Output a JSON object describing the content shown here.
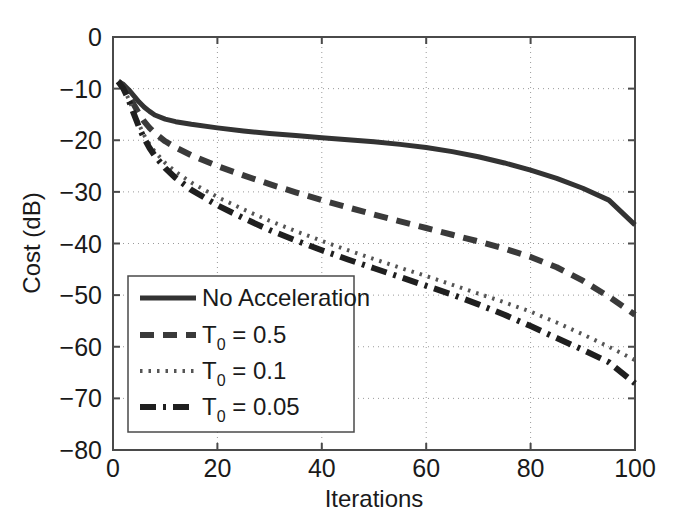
{
  "chart_data": {
    "type": "line",
    "title": "",
    "xlabel": "Iterations",
    "ylabel": "Cost (dB)",
    "xlim": [
      0,
      100
    ],
    "ylim": [
      -80,
      0
    ],
    "xticks": [
      0,
      20,
      40,
      60,
      80,
      100
    ],
    "yticks": [
      0,
      -10,
      -20,
      -30,
      -40,
      -50,
      -60,
      -70,
      -80
    ],
    "xtick_labels": [
      "0",
      "20",
      "40",
      "60",
      "80",
      "100"
    ],
    "ytick_labels": [
      "0",
      "-10",
      "-20",
      "-30",
      "-40",
      "-50",
      "-60",
      "-70",
      "-80"
    ],
    "grid": true,
    "grid_style": "dotted",
    "legend_position": "lower-left",
    "x": [
      1,
      2,
      3,
      4,
      5,
      6,
      7,
      8,
      10,
      12,
      15,
      20,
      25,
      30,
      35,
      40,
      45,
      50,
      55,
      60,
      65,
      70,
      75,
      80,
      85,
      90,
      95,
      100
    ],
    "series": [
      {
        "name": "No Acceleration",
        "style": "solid",
        "color": "#333333",
        "values": [
          -8.6,
          -9.2,
          -10.2,
          -11.4,
          -12.6,
          -13.6,
          -14.4,
          -15.1,
          -15.9,
          -16.4,
          -16.9,
          -17.6,
          -18.2,
          -18.7,
          -19.1,
          -19.5,
          -19.9,
          -20.3,
          -20.8,
          -21.4,
          -22.2,
          -23.2,
          -24.4,
          -25.8,
          -27.4,
          -29.3,
          -31.6,
          -36.4
        ]
      },
      {
        "name": "T_0 = 0.5",
        "legend_base": "T",
        "legend_sub": "0",
        "legend_rest": " = 0.5",
        "style": "dashed",
        "color": "#3a3a3a",
        "values": [
          -8.6,
          -9.6,
          -11.2,
          -13.1,
          -14.9,
          -16.4,
          -17.6,
          -18.6,
          -20.2,
          -21.4,
          -22.9,
          -25.0,
          -26.8,
          -28.5,
          -30.1,
          -31.6,
          -33.0,
          -34.4,
          -35.7,
          -37.0,
          -38.3,
          -39.6,
          -41.0,
          -42.6,
          -44.6,
          -47.2,
          -50.3,
          -53.8
        ]
      },
      {
        "name": "T_0 = 0.1",
        "legend_base": "T",
        "legend_sub": "0",
        "legend_rest": " = 0.1",
        "style": "dotted",
        "color": "#555555",
        "values": [
          -8.6,
          -9.9,
          -12.0,
          -14.5,
          -17.0,
          -19.1,
          -20.8,
          -22.2,
          -24.4,
          -26.1,
          -28.2,
          -31.0,
          -33.4,
          -35.6,
          -37.6,
          -39.5,
          -41.3,
          -43.0,
          -44.7,
          -46.3,
          -48.0,
          -49.7,
          -51.4,
          -53.2,
          -55.3,
          -57.6,
          -60.0,
          -62.6
        ]
      },
      {
        "name": "T_0 = 0.05",
        "legend_base": "T",
        "legend_sub": "0",
        "legend_rest": " = 0.05",
        "style": "dashdot",
        "color": "#1f1f1f",
        "values": [
          -8.6,
          -10.0,
          -12.2,
          -14.9,
          -17.5,
          -19.7,
          -21.5,
          -23.0,
          -25.4,
          -27.3,
          -29.6,
          -32.6,
          -35.1,
          -37.4,
          -39.4,
          -41.3,
          -43.1,
          -44.8,
          -46.5,
          -48.2,
          -49.9,
          -51.8,
          -53.8,
          -56.0,
          -58.3,
          -60.6,
          -63.0,
          -67.1
        ]
      }
    ]
  }
}
